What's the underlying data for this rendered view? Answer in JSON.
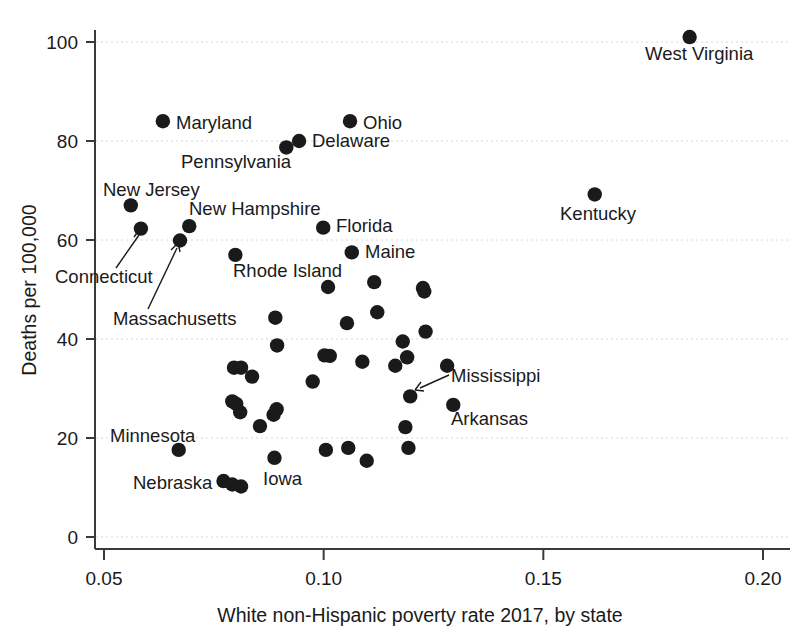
{
  "chart_data": {
    "type": "scatter",
    "title": "",
    "xlabel": "White non-Hispanic poverty rate 2017, by state",
    "ylabel": "Deaths per 100,000",
    "xlim": [
      0.042,
      0.205
    ],
    "ylim": [
      -4,
      107
    ],
    "xticks": [
      "0.05",
      "0.10",
      "0.15",
      "0.20"
    ],
    "xtick_values": [
      0.05,
      0.1,
      0.15,
      0.2
    ],
    "yticks": [
      "0",
      "20",
      "40",
      "60",
      "80",
      "100"
    ],
    "ytick_values": [
      0,
      20,
      40,
      60,
      80,
      100
    ],
    "grid": "horizontal dashed",
    "legend": "none",
    "marker_color": "#1a1a1a",
    "points": [
      {
        "label": "West Virginia",
        "x": 0.1833,
        "y": 101.0
      },
      {
        "label": "Ohio",
        "x": 0.106,
        "y": 84.0
      },
      {
        "label": "Maryland",
        "x": 0.0634,
        "y": 84.0
      },
      {
        "label": "Delaware",
        "x": 0.0944,
        "y": 80.0
      },
      {
        "label": "Pennsylvania",
        "x": 0.0915,
        "y": 78.7
      },
      {
        "label": "Kentucky",
        "x": 0.1617,
        "y": 69.2
      },
      {
        "label": "New Jersey",
        "x": 0.0561,
        "y": 67.0
      },
      {
        "label": "New Hampshire",
        "x": 0.0694,
        "y": 62.8
      },
      {
        "label": "Florida",
        "x": 0.0999,
        "y": 62.5
      },
      {
        "label": "Connecticut",
        "x": 0.0584,
        "y": 62.3
      },
      {
        "label": "Massachusetts",
        "x": 0.0673,
        "y": 59.9
      },
      {
        "label": "Maine",
        "x": 0.1064,
        "y": 57.5
      },
      {
        "label": "Rhode Island",
        "x": 0.0799,
        "y": 57.0
      },
      {
        "label": "",
        "x": 0.1226,
        "y": 50.3
      },
      {
        "label": "",
        "x": 0.1229,
        "y": 49.6
      },
      {
        "label": "",
        "x": 0.1115,
        "y": 51.5
      },
      {
        "label": "",
        "x": 0.101,
        "y": 50.5
      },
      {
        "label": "",
        "x": 0.1122,
        "y": 45.4
      },
      {
        "label": "",
        "x": 0.1053,
        "y": 43.2
      },
      {
        "label": "",
        "x": 0.089,
        "y": 44.3
      },
      {
        "label": "",
        "x": 0.1232,
        "y": 41.5
      },
      {
        "label": "",
        "x": 0.118,
        "y": 39.5
      },
      {
        "label": "",
        "x": 0.0894,
        "y": 38.7
      },
      {
        "label": "",
        "x": 0.1002,
        "y": 36.7
      },
      {
        "label": "",
        "x": 0.1014,
        "y": 36.6
      },
      {
        "label": "",
        "x": 0.119,
        "y": 36.3
      },
      {
        "label": "",
        "x": 0.0796,
        "y": 34.2
      },
      {
        "label": "",
        "x": 0.0812,
        "y": 34.2
      },
      {
        "label": "",
        "x": 0.1088,
        "y": 35.4
      },
      {
        "label": "",
        "x": 0.1163,
        "y": 34.6
      },
      {
        "label": "",
        "x": 0.1281,
        "y": 34.6
      },
      {
        "label": "",
        "x": 0.0975,
        "y": 31.4
      },
      {
        "label": "",
        "x": 0.0837,
        "y": 32.4
      },
      {
        "label": "Mississippi",
        "x": 0.1197,
        "y": 28.4
      },
      {
        "label": "Arkansas",
        "x": 0.1295,
        "y": 26.7
      },
      {
        "label": "",
        "x": 0.0792,
        "y": 27.4
      },
      {
        "label": "",
        "x": 0.0801,
        "y": 26.9
      },
      {
        "label": "",
        "x": 0.0893,
        "y": 25.8
      },
      {
        "label": "",
        "x": 0.081,
        "y": 25.2
      },
      {
        "label": "",
        "x": 0.0886,
        "y": 24.7
      },
      {
        "label": "",
        "x": 0.0855,
        "y": 22.4
      },
      {
        "label": "",
        "x": 0.1186,
        "y": 22.2
      },
      {
        "label": "",
        "x": 0.1056,
        "y": 18.0
      },
      {
        "label": "",
        "x": 0.1193,
        "y": 18.0
      },
      {
        "label": "Minnesota",
        "x": 0.067,
        "y": 17.6
      },
      {
        "label": "",
        "x": 0.1005,
        "y": 17.6
      },
      {
        "label": "Iowa",
        "x": 0.0888,
        "y": 16.0
      },
      {
        "label": "",
        "x": 0.1098,
        "y": 15.4
      },
      {
        "label": "Nebraska",
        "x": 0.0772,
        "y": 11.3
      },
      {
        "label": "",
        "x": 0.0792,
        "y": 10.6
      },
      {
        "label": "",
        "x": 0.0812,
        "y": 10.2
      }
    ],
    "annotations": [
      {
        "text": "Maryland",
        "anchor": "right-of-point"
      },
      {
        "text": "Ohio",
        "anchor": "right-of-point"
      },
      {
        "text": "Delaware",
        "anchor": "right-of-point"
      },
      {
        "text": "Pennsylvania",
        "anchor": "below-left-of-point"
      },
      {
        "text": "New Jersey",
        "anchor": "above-point"
      },
      {
        "text": "New Hampshire",
        "anchor": "above-right-of-point"
      },
      {
        "text": "Connecticut",
        "anchor": "leader-line"
      },
      {
        "text": "Massachusetts",
        "anchor": "leader-line"
      },
      {
        "text": "Rhode Island",
        "anchor": "below-point"
      },
      {
        "text": "Florida",
        "anchor": "right-of-point"
      },
      {
        "text": "Maine",
        "anchor": "right-of-point"
      },
      {
        "text": "West Virginia",
        "anchor": "below-point"
      },
      {
        "text": "Kentucky",
        "anchor": "below-point"
      },
      {
        "text": "Mississippi",
        "anchor": "leader-line"
      },
      {
        "text": "Arkansas",
        "anchor": "below-point"
      },
      {
        "text": "Minnesota",
        "anchor": "above-left-of-point"
      },
      {
        "text": "Nebraska",
        "anchor": "left-of-point"
      },
      {
        "text": "Iowa",
        "anchor": "below-right-of-point"
      }
    ]
  },
  "labels": {
    "y_axis_title": "Deaths per 100,000",
    "x_axis_title": "White non-Hispanic poverty rate 2017, by state",
    "state_maryland": "Maryland",
    "state_ohio": "Ohio",
    "state_delaware": "Delaware",
    "state_pennsylvania": "Pennsylvania",
    "state_new_jersey": "New Jersey",
    "state_new_hampshire": "New Hampshire",
    "state_connecticut": "Connecticut",
    "state_massachusetts": "Massachusetts",
    "state_rhode_island": "Rhode Island",
    "state_florida": "Florida",
    "state_maine": "Maine",
    "state_west_virginia": "West Virginia",
    "state_kentucky": "Kentucky",
    "state_mississippi": "Mississippi",
    "state_arkansas": "Arkansas",
    "state_minnesota": "Minnesota",
    "state_nebraska": "Nebraska",
    "state_iowa": "Iowa",
    "ytick_0": "0",
    "ytick_20": "20",
    "ytick_40": "40",
    "ytick_60": "60",
    "ytick_80": "80",
    "ytick_100": "100",
    "xtick_005": "0.05",
    "xtick_010": "0.10",
    "xtick_015": "0.15",
    "xtick_020": "0.20"
  }
}
